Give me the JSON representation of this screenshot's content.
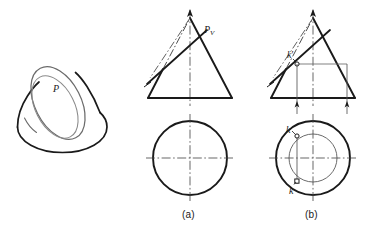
{
  "figure": {
    "background_color": "#ffffff",
    "ink_color": "#1a1a1a",
    "thin_color": "#555555",
    "centerline_color": "#4d4d4d"
  },
  "pictorial": {
    "name": "cone-pictorial",
    "plane_label": "P",
    "description": "Oblique pictorial of a cone truncated by cutting plane P showing elliptical section"
  },
  "view_a": {
    "caption": "(a)",
    "front_view": {
      "name": "cone-front-view-a",
      "trace_label": "P",
      "trace_label_sub": "V"
    },
    "top_view": {
      "name": "cone-top-view-a"
    }
  },
  "view_b": {
    "caption": "(b)",
    "front_view": {
      "name": "cone-front-view-b",
      "point_label": "k",
      "point_label_prime": "′"
    },
    "top_view": {
      "name": "cone-top-view-b",
      "point_label_upper": "k",
      "point_label_lower": "k"
    }
  },
  "geometry": {
    "pictorial": {
      "base_ellipse_cx": 62,
      "base_ellipse_cy": 132,
      "base_ellipse_rx": 45,
      "base_ellipse_ry": 21,
      "cut_ellipse_cx": 58,
      "cut_ellipse_cy": 104,
      "cut_ellipse_rx": 23,
      "cut_ellipse_ry": 38,
      "cut_ellipse_rotation": -28
    },
    "view_a": {
      "apex_x": 190,
      "apex_y": 18,
      "base_y": 98,
      "base_left_x": 148,
      "base_right_x": 232,
      "circle_cx": 190,
      "circle_cy": 158,
      "circle_r": 37
    },
    "view_b": {
      "apex_x": 313,
      "apex_y": 18,
      "base_y": 98,
      "base_left_x": 271,
      "base_right_x": 355,
      "circle_cx": 313,
      "circle_cy": 158,
      "circle_outer_r": 37,
      "circle_inner_r": 24,
      "k_prime_x": 297,
      "k_prime_y": 57,
      "k_upper_x": 301,
      "k_upper_y": 134,
      "k_lower_x": 301,
      "k_lower_y": 184
    }
  }
}
